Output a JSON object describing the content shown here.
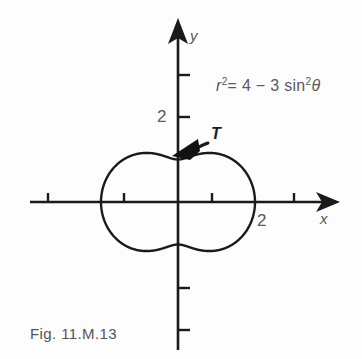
{
  "figure": {
    "caption": "Fig. 11.M.13",
    "equation_plain": "r^2 = 4 - 3 sin^2 θ",
    "equation_parts": {
      "r": "r",
      "exp2_a": "2",
      "equals": "= 4 ",
      "minus": "−",
      "three_sin": " 3 sin",
      "exp2_b": "2",
      "theta": "θ"
    },
    "tangent_label": "T",
    "axis_x_label": "x",
    "axis_y_label": "y",
    "x_tick_label": "2",
    "y_tick_label": "2",
    "line_color": "#1a1a1a",
    "text_color": "#555555"
  },
  "chart_data": {
    "type": "line",
    "title": "",
    "subtitle": "",
    "annotation": "r^2 = 4 - 3 sin^2 θ",
    "curve_name": "polar curve r^2 = 4 - 3 sin^2 theta",
    "coordinate_system": "polar-plotted-on-cartesian",
    "xlabel": "x",
    "ylabel": "y",
    "grid": false,
    "legend": "none",
    "xlim": [
      -3.5,
      3.7
    ],
    "ylim": [
      -3.5,
      3.6
    ],
    "xticks": [
      -3,
      -2,
      -1,
      1,
      2,
      3
    ],
    "yticks": [
      -3,
      -2,
      2,
      3
    ],
    "xtick_labels_shown": [
      "2"
    ],
    "ytick_labels_shown": [
      "2"
    ],
    "r_max": 2.0,
    "r_min": 1.0,
    "r_at_theta_0_deg": 2.0,
    "r_at_theta_90_deg": 1.0,
    "r_at_theta_180_deg": 2.0,
    "r_at_theta_270_deg": 1.0,
    "theta_deg": [
      0,
      15,
      30,
      45,
      60,
      75,
      90,
      105,
      120,
      135,
      150,
      165,
      180,
      195,
      210,
      225,
      240,
      255,
      270,
      285,
      300,
      315,
      330,
      345,
      360
    ],
    "r_values": [
      2.0,
      1.949,
      1.803,
      1.581,
      1.323,
      1.107,
      1.0,
      1.107,
      1.323,
      1.581,
      1.803,
      1.949,
      2.0,
      1.949,
      1.803,
      1.581,
      1.323,
      1.107,
      1.0,
      1.107,
      1.323,
      1.581,
      1.803,
      1.949,
      2.0
    ],
    "annotations": [
      {
        "text": "T",
        "kind": "tangent-vector",
        "at_theta_deg": 90,
        "at_point": [
          0.0,
          1.0
        ],
        "direction": "counterclockwise"
      },
      {
        "text": "2",
        "kind": "axis-tick-label",
        "axis": "x",
        "value": 2
      },
      {
        "text": "2",
        "kind": "axis-tick-label",
        "axis": "y",
        "value": 2
      }
    ]
  }
}
